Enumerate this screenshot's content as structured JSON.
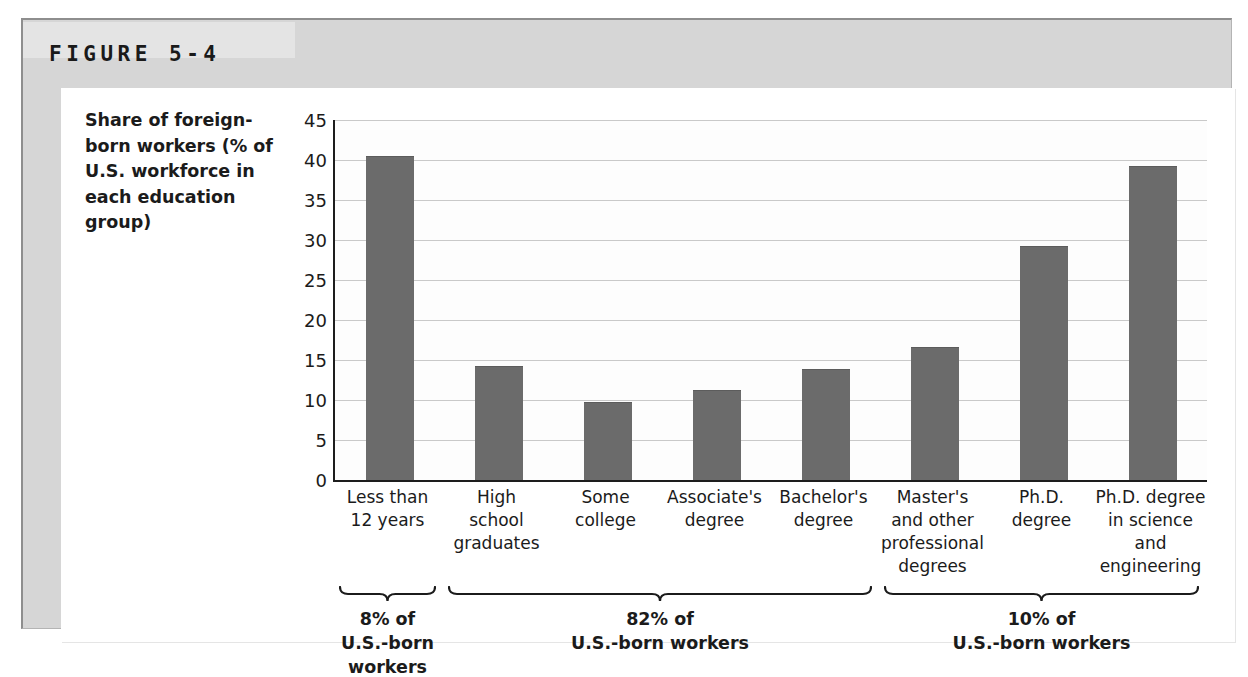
{
  "figure": {
    "label": "FIGURE 5-4"
  },
  "chart_data": {
    "type": "bar",
    "title": "",
    "xlabel": "",
    "ylabel": "Share of foreign-born workers (% of U.S. workforce in each education group)",
    "ylabel_lines": "Share of foreign-\nborn workers\n(% of U.S.\nworkforce in\neach education\ngroup)",
    "ylim": [
      0,
      45
    ],
    "ytick_values": [
      0,
      5,
      10,
      15,
      20,
      25,
      30,
      35,
      40,
      45
    ],
    "ytick_labels": [
      "0",
      "5",
      "10",
      "15",
      "20",
      "25",
      "30",
      "35",
      "40",
      "45"
    ],
    "grid": true,
    "legend": "none",
    "bar_color": "#6b6b6b",
    "categories": [
      "Less than\n12 years",
      "High\nschool\ngraduates",
      "Some\ncollege",
      "Associate's\ndegree",
      "Bachelor's\ndegree",
      "Master's\nand other\nprofessional\ndegrees",
      "Ph.D.\ndegree",
      "Ph.D. degree\nin science\nand\nengineering"
    ],
    "values": [
      40.5,
      14.3,
      9.8,
      11.3,
      13.9,
      16.6,
      29.3,
      39.3
    ]
  },
  "annotations": {
    "brackets": [
      {
        "id": "bracket-8-percent",
        "percent": "8% of",
        "caption": "8% of\nU.S.-born workers",
        "covers": [
          0,
          0
        ]
      },
      {
        "id": "bracket-82-percent",
        "percent": "82% of",
        "caption": "82% of\nU.S.-born workers",
        "covers": [
          1,
          4
        ]
      },
      {
        "id": "bracket-10-percent",
        "percent": "10% of",
        "caption": "10% of\nU.S.-born workers",
        "covers": [
          5,
          7
        ]
      }
    ]
  },
  "colors": {
    "panel_background": "#d6d6d6",
    "card_background": "#ffffff",
    "bar_fill": "#6b6b6b",
    "gridline": "#c9c9c9",
    "axis": "#1d1d1d",
    "text": "#1b1b1b"
  }
}
